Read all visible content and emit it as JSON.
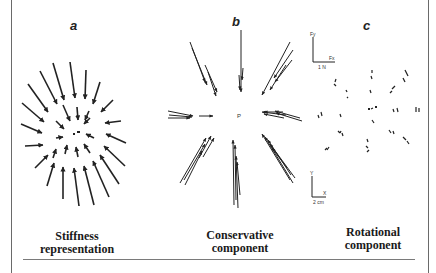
{
  "figure": {
    "panels": [
      {
        "id": "a",
        "letter": "a",
        "caption_line1": "Stiffness",
        "caption_line2": "representation"
      },
      {
        "id": "b",
        "letter": "b",
        "caption_line1": "Conservative",
        "caption_line2": "component"
      },
      {
        "id": "c",
        "letter": "c",
        "caption_line1": "Rotational",
        "caption_line2": "component"
      }
    ],
    "scale_bars": {
      "force": {
        "y_label": "Fy",
        "x_label": "Fx",
        "unit_label": "1 N"
      },
      "position": {
        "y_label": "Y",
        "x_label": "X",
        "unit_label": "2 cm"
      }
    },
    "center_label": "P",
    "colors": {
      "ink": "#222222",
      "frame": "#6a6a6a",
      "background": "#ffffff"
    }
  }
}
